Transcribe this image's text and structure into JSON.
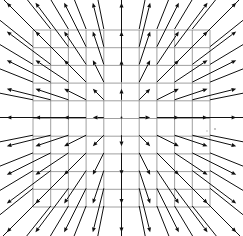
{
  "figure": {
    "kind": "quiver-plot",
    "width": 243,
    "height": 236,
    "background_color": "#ffffff"
  },
  "chart_data": {
    "type": "scatter",
    "plot_subtype": "quiver",
    "xlabel": "",
    "ylabel": "",
    "xlim": [
      -5,
      5
    ],
    "ylim": [
      -5,
      5
    ],
    "grid": true,
    "grid_color": "#888888",
    "grid_rows": 10,
    "grid_cols": 10,
    "legend": "none",
    "arrow_color": "#101010",
    "field_description": "Outward radial source field; arrow direction is away from the origin and arrow length grows with distance from the origin.",
    "field_formula": "F(x, y) = (x, y)",
    "sample_nx": 11,
    "sample_ny": 11,
    "x": [
      -5,
      -4,
      -3,
      -2,
      -1,
      0,
      1,
      2,
      3,
      4,
      5
    ],
    "y": [
      -5,
      -4,
      -3,
      -2,
      -1,
      0,
      1,
      2,
      3,
      4,
      5
    ],
    "magnitude_scale": 0.62,
    "arrow_head_length": 4.6,
    "arrow_head_half_width": 2.0,
    "min_magnitude": 0.0,
    "max_magnitude": 7.07,
    "annotations": []
  },
  "geometry": {
    "origin_x": 121.5,
    "origin_y": 117.5,
    "cell_px": 17.7,
    "grid_left": 33.0,
    "grid_top": 30.0,
    "grid_right": 210.0,
    "grid_bottom": 207.0,
    "grid_line_count": 11
  },
  "specks": [
    {
      "x": 215,
      "y": 129,
      "r": 1.1
    },
    {
      "x": 207,
      "y": 131,
      "r": 0.8
    }
  ]
}
